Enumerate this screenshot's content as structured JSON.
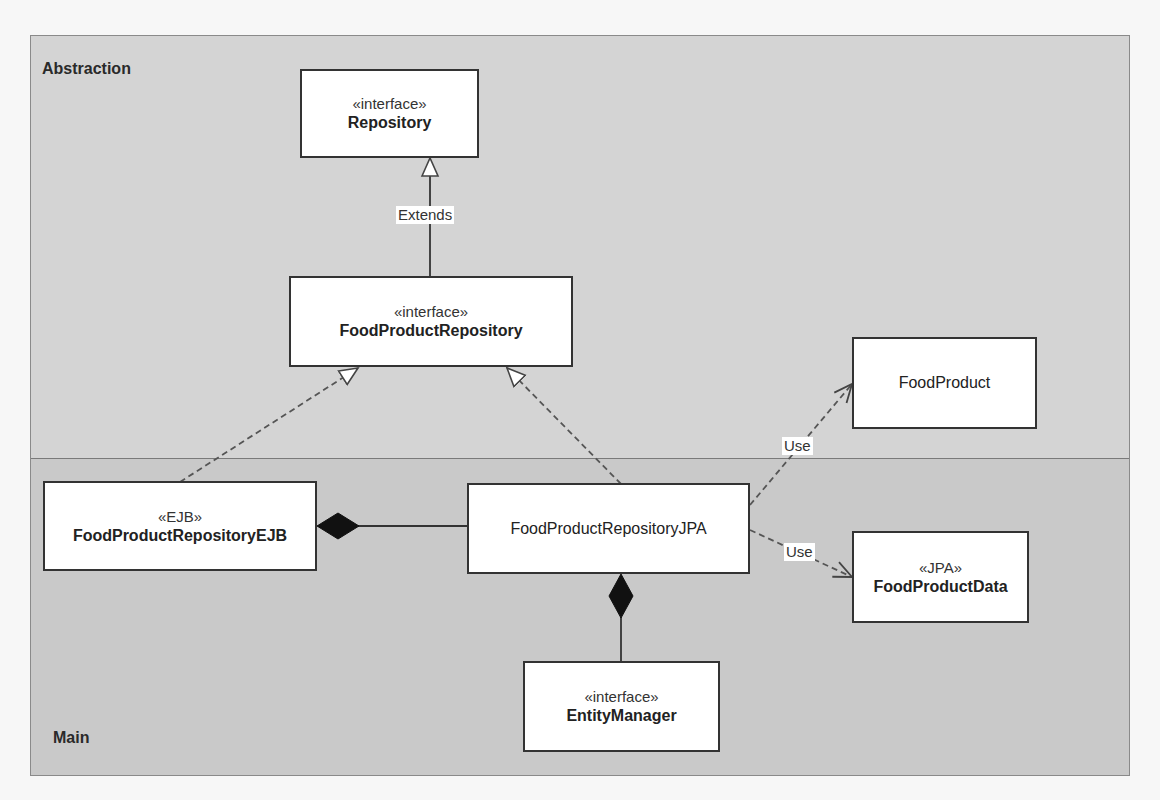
{
  "diagram": {
    "type": "UML class diagram",
    "sections": {
      "abstraction": {
        "label": "Abstraction"
      },
      "main": {
        "label": "Main"
      }
    },
    "classes": {
      "repository": {
        "stereotype": "«interface»",
        "name": "Repository",
        "bold": true
      },
      "food_product_repository": {
        "stereotype": "«interface»",
        "name": "FoodProductRepository",
        "bold": true
      },
      "food_product": {
        "stereotype": "",
        "name": "FoodProduct",
        "bold": false
      },
      "food_product_repository_ejb": {
        "stereotype": "«EJB»",
        "name": "FoodProductRepositoryEJB",
        "bold": true
      },
      "food_product_repository_jpa": {
        "stereotype": "",
        "name": "FoodProductRepositoryJPA",
        "bold": false
      },
      "food_product_data": {
        "stereotype": "«JPA»",
        "name": "FoodProductData",
        "bold": true
      },
      "entity_manager": {
        "stereotype": "«interface»",
        "name": "EntityManager",
        "bold": true
      }
    },
    "relations": [
      {
        "from": "FoodProductRepository",
        "to": "Repository",
        "kind": "generalization",
        "label": "Extends"
      },
      {
        "from": "FoodProductRepositoryEJB",
        "to": "FoodProductRepository",
        "kind": "realization",
        "label": ""
      },
      {
        "from": "FoodProductRepositoryJPA",
        "to": "FoodProductRepository",
        "kind": "realization",
        "label": ""
      },
      {
        "from": "FoodProductRepositoryJPA",
        "to": "FoodProduct",
        "kind": "dependency",
        "label": "Use"
      },
      {
        "from": "FoodProductRepositoryJPA",
        "to": "FoodProductData",
        "kind": "dependency",
        "label": "Use"
      },
      {
        "from": "FoodProductRepositoryEJB",
        "to": "FoodProductRepositoryJPA",
        "kind": "composition",
        "label": ""
      },
      {
        "from": "FoodProductRepositoryJPA",
        "to": "EntityManager",
        "kind": "composition",
        "label": ""
      }
    ],
    "edge_labels": {
      "extends": "Extends",
      "use_food_product": "Use",
      "use_food_product_data": "Use"
    },
    "colors": {
      "abstraction_bg": "#d4d4d4",
      "main_bg": "#c9c9c9",
      "box_bg": "#ffffff",
      "line": "#333333"
    }
  }
}
